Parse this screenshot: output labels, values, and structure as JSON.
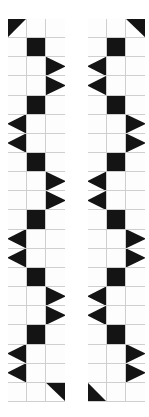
{
  "artwork": {
    "title": "Two vertical black-and-white patchwork strips",
    "background_color": "#ffffff",
    "ink_color": "#141414",
    "paper_color": "#fdfdfd",
    "grid_line_color": "#cfcfcf",
    "border_color": "#b9b9b9",
    "columns": 3,
    "rows": 20
  },
  "panels": [
    {
      "name": "left-panel",
      "label": "Left strip",
      "cells": [
        "tri-tl",
        "white",
        "white",
        "white",
        "black",
        "white",
        "white",
        "white",
        "tri-left",
        "white",
        "white",
        "tri-left",
        "white",
        "black",
        "white",
        "tri-right",
        "white",
        "white",
        "tri-right",
        "white",
        "white",
        "white",
        "black",
        "white",
        "white",
        "white",
        "tri-left",
        "white",
        "white",
        "tri-left",
        "white",
        "black",
        "white",
        "tri-right",
        "white",
        "white",
        "tri-right",
        "white",
        "white",
        "white",
        "black",
        "white",
        "white",
        "white",
        "tri-left",
        "white",
        "white",
        "tri-left",
        "white",
        "black",
        "white",
        "tri-right",
        "white",
        "white",
        "tri-right",
        "white",
        "white",
        "white",
        "white",
        "tri-tr"
      ]
    },
    {
      "name": "right-panel",
      "label": "Right strip",
      "cells": [
        "white",
        "white",
        "tri-tr",
        "white",
        "black",
        "white",
        "tri-right",
        "white",
        "white",
        "tri-right",
        "white",
        "white",
        "white",
        "black",
        "white",
        "white",
        "white",
        "tri-left",
        "white",
        "white",
        "tri-left",
        "white",
        "black",
        "white",
        "tri-right",
        "white",
        "white",
        "tri-right",
        "white",
        "white",
        "white",
        "black",
        "white",
        "white",
        "white",
        "tri-left",
        "white",
        "white",
        "tri-left",
        "white",
        "black",
        "white",
        "tri-right",
        "white",
        "white",
        "tri-right",
        "white",
        "white",
        "white",
        "black",
        "white",
        "white",
        "white",
        "tri-left",
        "white",
        "white",
        "tri-left",
        "tri-bl",
        "white",
        "white"
      ]
    }
  ]
}
